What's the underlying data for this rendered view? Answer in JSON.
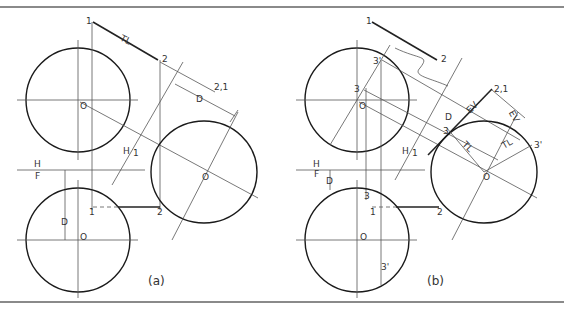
{
  "figure_a": {
    "caption": "(a)",
    "labels": {
      "p1_top": "1",
      "tl": "TL",
      "p2_top": "2",
      "p21_aux": "2,1",
      "dim_d_aux": "D",
      "o_top": "O",
      "h1": "H",
      "h1_sub": "1",
      "o_aux": "O",
      "h": "H",
      "f": "F",
      "dim_d_front": "D",
      "o_front": "O",
      "p1_front": "1",
      "p2_front": "2"
    }
  },
  "figure_b": {
    "caption": "(b)",
    "labels": {
      "p1_top": "1",
      "p2_top": "2",
      "p3p_top": "3'",
      "p3_top": "3",
      "o_top": "O",
      "p21_aux": "2,1",
      "ev1": "EV",
      "ev2": "EV",
      "dim_d_aux": "D",
      "p3_aux": "3",
      "tl1": "TL",
      "tl2": "TL",
      "p3p_aux": "3'",
      "h1": "H",
      "h1_sub": "1",
      "o_aux": "O",
      "h": "H",
      "f": "F",
      "dim_d_front": "D",
      "p3_front": "3",
      "p1_front": "1",
      "p2_front": "2",
      "o_front": "O",
      "p3p_front": "3'"
    }
  }
}
